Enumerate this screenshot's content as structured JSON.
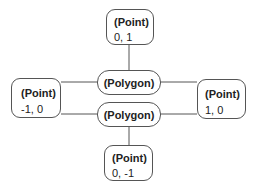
{
  "diagram": {
    "nodes": [
      {
        "id": "top",
        "type": "(Point)",
        "value": "0, 1"
      },
      {
        "id": "left",
        "type": "(Point)",
        "value": "-1, 0"
      },
      {
        "id": "right",
        "type": "(Point)",
        "value": "1, 0"
      },
      {
        "id": "bottom",
        "type": "(Point)",
        "value": "0, -1"
      },
      {
        "id": "poly1",
        "type": "(Polygon)"
      },
      {
        "id": "poly2",
        "type": "(Polygon)"
      }
    ],
    "edges": [
      {
        "from": "top",
        "to": "poly1"
      },
      {
        "from": "left",
        "to": "poly1"
      },
      {
        "from": "right",
        "to": "poly1"
      },
      {
        "from": "left",
        "to": "poly2"
      },
      {
        "from": "right",
        "to": "poly2"
      },
      {
        "from": "bottom",
        "to": "poly2"
      }
    ]
  }
}
